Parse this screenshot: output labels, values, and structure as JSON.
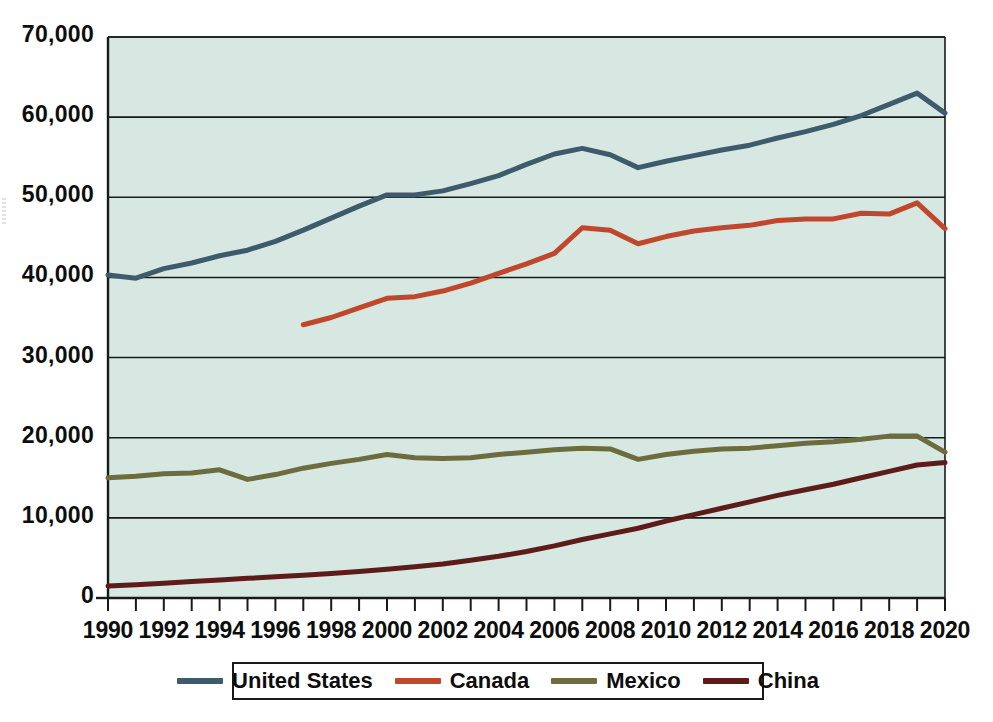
{
  "chart_data": {
    "type": "line",
    "title": "",
    "subtitle": "",
    "xlabel": "",
    "ylabel": "",
    "xlim": [
      1990,
      2020
    ],
    "ylim": [
      0,
      70000
    ],
    "grid": true,
    "grid_axis": "y",
    "legend_position": "bottom",
    "plot_background": "#d7e7e1",
    "x": [
      1990,
      1991,
      1992,
      1993,
      1994,
      1995,
      1996,
      1997,
      1998,
      1999,
      2000,
      2001,
      2002,
      2003,
      2004,
      2005,
      2006,
      2007,
      2008,
      2009,
      2010,
      2011,
      2012,
      2013,
      2014,
      2015,
      2016,
      2017,
      2018,
      2019,
      2020
    ],
    "y_ticks": [
      0,
      10000,
      20000,
      30000,
      40000,
      50000,
      60000,
      70000
    ],
    "y_tick_labels": [
      "0",
      "10,000",
      "20,000",
      "30,000",
      "40,000",
      "50,000",
      "60,000",
      "70,000"
    ],
    "x_ticks": [
      1990,
      1991,
      1992,
      1993,
      1994,
      1995,
      1996,
      1997,
      1998,
      1999,
      2000,
      2001,
      2002,
      2003,
      2004,
      2005,
      2006,
      2007,
      2008,
      2009,
      2010,
      2011,
      2012,
      2013,
      2014,
      2015,
      2016,
      2017,
      2018,
      2019,
      2020
    ],
    "x_tick_labels": [
      "1990",
      "",
      "1992",
      "",
      "1994",
      "",
      "1996",
      "",
      "1998",
      "",
      "2000",
      "",
      "2002",
      "",
      "2004",
      "",
      "2006",
      "",
      "2008",
      "",
      "2010",
      "",
      "2012",
      "",
      "2014",
      "",
      "2016",
      "",
      "2018",
      "",
      "2020"
    ],
    "x_major_labels": [
      "1990",
      "1992",
      "1994",
      "1996",
      "1998",
      "2000",
      "2002",
      "2004",
      "2006",
      "2008",
      "2010",
      "2012",
      "2014",
      "2016",
      "2018",
      "2020"
    ],
    "series": [
      {
        "name": "United States",
        "color": "#3e5b6c",
        "x": [
          1990,
          1991,
          1992,
          1993,
          1994,
          1995,
          1996,
          1997,
          1998,
          1999,
          2000,
          2001,
          2002,
          2003,
          2004,
          2005,
          2006,
          2007,
          2008,
          2009,
          2010,
          2011,
          2012,
          2013,
          2014,
          2015,
          2016,
          2017,
          2018,
          2019,
          2020
        ],
        "values": [
          40300,
          39900,
          41100,
          41800,
          42700,
          43400,
          44500,
          45900,
          47400,
          48900,
          50300,
          50300,
          50800,
          51700,
          52700,
          54100,
          55400,
          56100,
          55300,
          53700,
          54500,
          55200,
          55900,
          56500,
          57400,
          58200,
          59100,
          60200,
          61600,
          63000,
          60500
        ],
        "linewidth": 5
      },
      {
        "name": "Canada",
        "color": "#c0472b",
        "x": [
          1997,
          1998,
          1999,
          2000,
          2001,
          2002,
          2003,
          2004,
          2005,
          2006,
          2007,
          2008,
          2009,
          2010,
          2011,
          2012,
          2013,
          2014,
          2015,
          2016,
          2017,
          2018,
          2019,
          2020
        ],
        "values": [
          34100,
          35000,
          36200,
          37400,
          37600,
          38300,
          39300,
          40500,
          41700,
          43000,
          46200,
          45900,
          44200,
          45100,
          45800,
          46200,
          46500,
          47100,
          47300,
          47300,
          48000,
          47900,
          49300,
          46100
        ],
        "linewidth": 5
      },
      {
        "name": "Mexico",
        "color": "#6d6c3f",
        "x": [
          1990,
          1991,
          1992,
          1993,
          1994,
          1995,
          1996,
          1997,
          1998,
          1999,
          2000,
          2001,
          2002,
          2003,
          2004,
          2005,
          2006,
          2007,
          2008,
          2009,
          2010,
          2011,
          2012,
          2013,
          2014,
          2015,
          2016,
          2017,
          2018,
          2019,
          2020
        ],
        "values": [
          15000,
          15200,
          15500,
          15600,
          16000,
          14800,
          15400,
          16200,
          16800,
          17300,
          17900,
          17500,
          17400,
          17500,
          17900,
          18200,
          18500,
          18700,
          18600,
          17300,
          17900,
          18300,
          18600,
          18700,
          19000,
          19300,
          19500,
          19800,
          20200,
          20200,
          18200
        ],
        "linewidth": 5
      },
      {
        "name": "China",
        "color": "#5d1b19",
        "x": [
          1990,
          1991,
          1992,
          1993,
          1994,
          1995,
          1996,
          1997,
          1998,
          1999,
          2000,
          2001,
          2002,
          2003,
          2004,
          2005,
          2006,
          2007,
          2008,
          2009,
          2010,
          2011,
          2012,
          2013,
          2014,
          2015,
          2016,
          2017,
          2018,
          2019,
          2020
        ],
        "values": [
          1500,
          1650,
          1850,
          2050,
          2250,
          2450,
          2650,
          2850,
          3050,
          3300,
          3600,
          3900,
          4250,
          4700,
          5200,
          5800,
          6500,
          7300,
          8000,
          8700,
          9600,
          10400,
          11200,
          12000,
          12800,
          13500,
          14200,
          15000,
          15800,
          16600,
          16900
        ],
        "linewidth": 5
      }
    ]
  },
  "legend": {
    "items": [
      {
        "label": "United States",
        "color": "#3e5b6c"
      },
      {
        "label": "Canada",
        "color": "#c0472b"
      },
      {
        "label": "Mexico",
        "color": "#6d6c3f"
      },
      {
        "label": "China",
        "color": "#5d1b19"
      }
    ]
  },
  "axes": {
    "frame_color": "#1a1a1a",
    "gridline_color": "#1a1a1a",
    "tick_color": "#1a1a1a"
  }
}
